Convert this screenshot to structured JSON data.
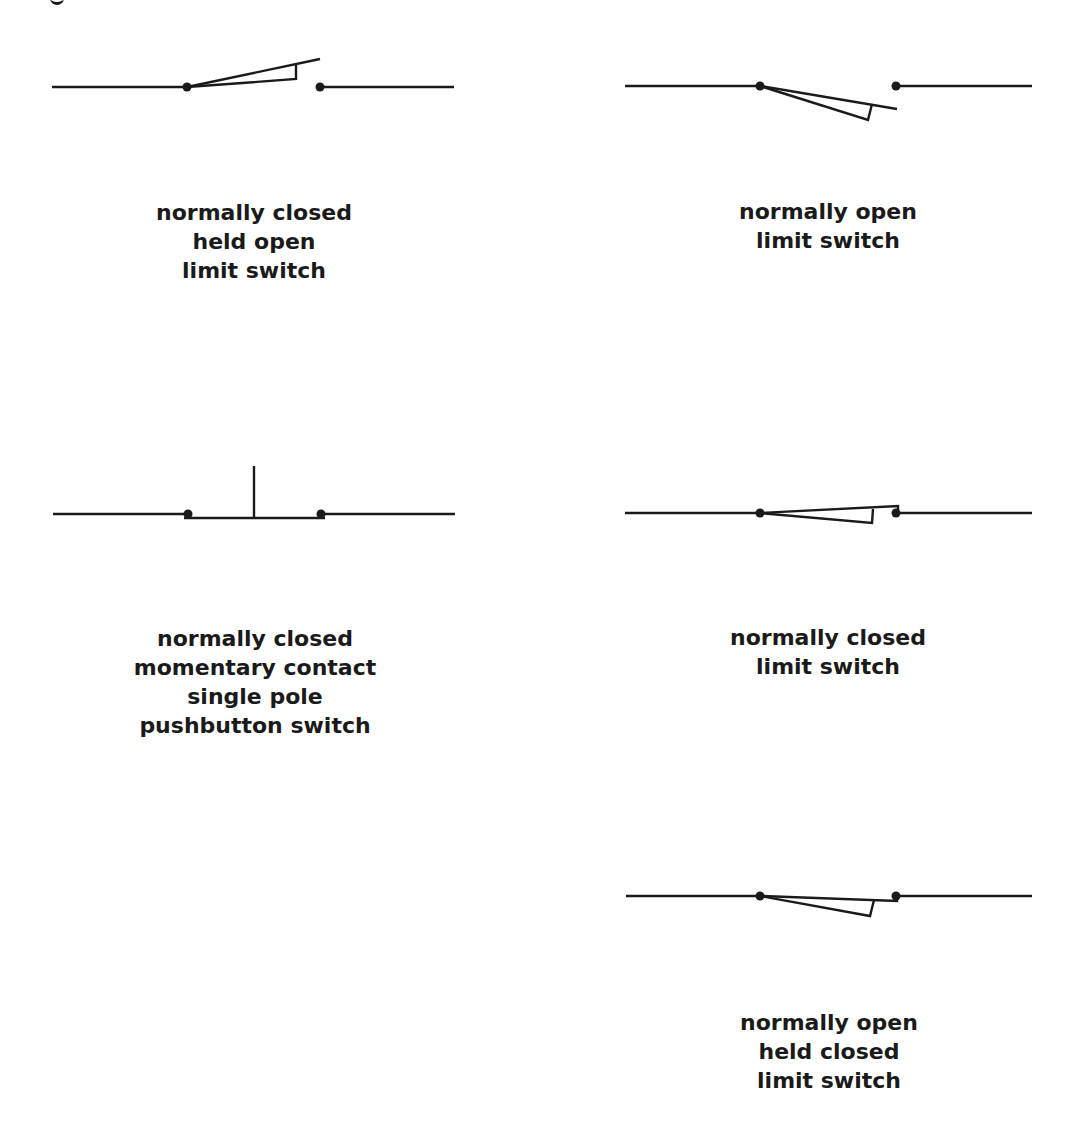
{
  "diagram": {
    "type": "electrical switch symbols",
    "stroke_color": "#1a1a1a",
    "background": "#ffffff",
    "symbols": [
      {
        "id": "nc-held-open-limit",
        "label_lines": [
          "normally closed",
          "held open",
          "limit switch"
        ]
      },
      {
        "id": "no-limit",
        "label_lines": [
          "normally open",
          "limit switch"
        ]
      },
      {
        "id": "nc-momentary-pushbutton",
        "label_lines": [
          "normally closed",
          "momentary contact",
          "single pole",
          "pushbutton switch"
        ]
      },
      {
        "id": "nc-limit",
        "label_lines": [
          "normally closed",
          "limit switch"
        ]
      },
      {
        "id": "no-held-closed-limit",
        "label_lines": [
          "normally open",
          "held closed",
          "limit switch"
        ]
      }
    ]
  }
}
